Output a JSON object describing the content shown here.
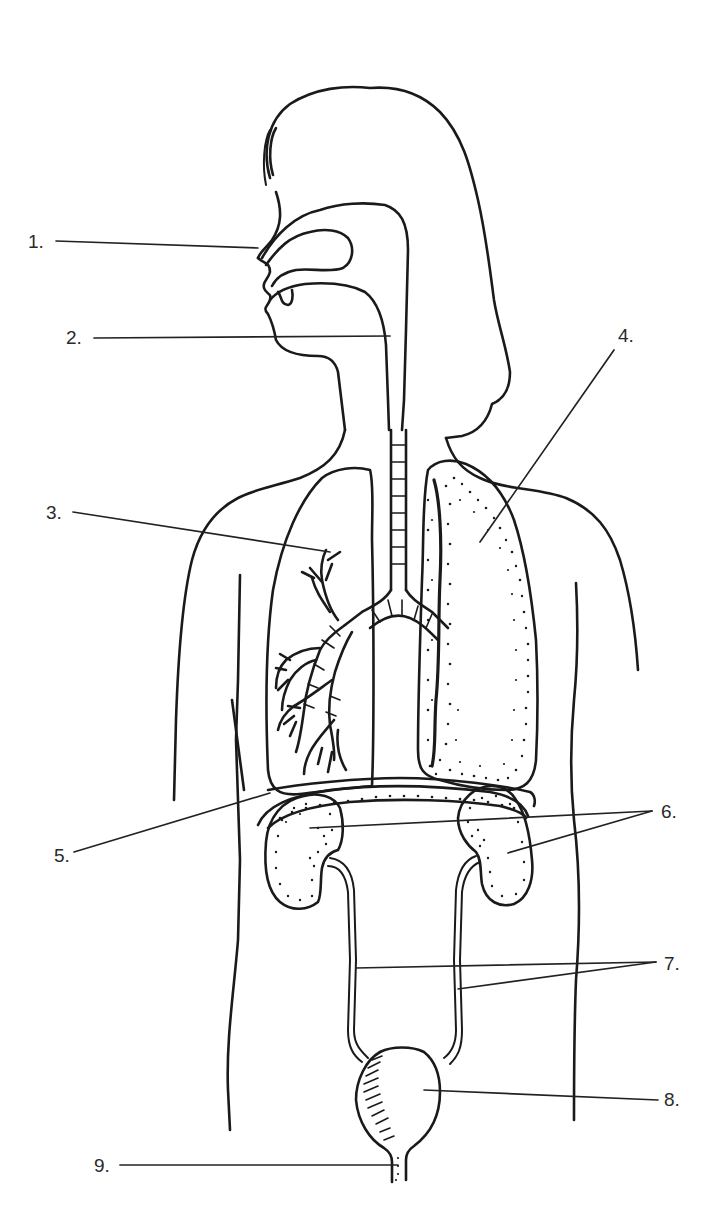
{
  "diagram": {
    "colors": {
      "line": "#1a1a1a",
      "background": "#ffffff",
      "label_text": "#2a2a2a"
    },
    "labels": [
      {
        "id": "1",
        "text": "1.",
        "x": 28,
        "y": 232,
        "target": "nostril"
      },
      {
        "id": "2",
        "text": "2.",
        "x": 66,
        "y": 328,
        "target": "trachea"
      },
      {
        "id": "3",
        "text": "3.",
        "x": 46,
        "y": 505,
        "target": "bronchus"
      },
      {
        "id": "4",
        "text": "4.",
        "x": 618,
        "y": 326,
        "target": "lung"
      },
      {
        "id": "5",
        "text": "5.",
        "x": 54,
        "y": 846,
        "target": "diaphragm"
      },
      {
        "id": "6",
        "text": "6.",
        "x": 661,
        "y": 802,
        "target": "kidneys"
      },
      {
        "id": "7",
        "text": "7.",
        "x": 664,
        "y": 954,
        "target": "ureters"
      },
      {
        "id": "8",
        "text": "8.",
        "x": 664,
        "y": 1090,
        "target": "bladder"
      },
      {
        "id": "9",
        "text": "9.",
        "x": 94,
        "y": 1158,
        "target": "urethra"
      }
    ]
  }
}
